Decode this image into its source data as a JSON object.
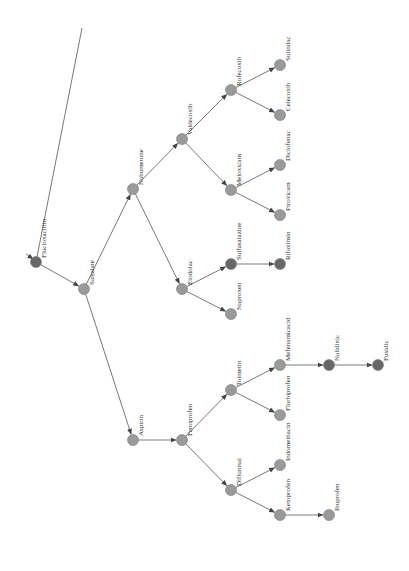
{
  "diagram": {
    "type": "tree",
    "orientation": "rotated",
    "colors": {
      "node_light": "#9a9a9a",
      "node_dark": "#686868",
      "edge": "#555555",
      "text": "#333333"
    },
    "nodes": [
      {
        "id": "flucloxacillin",
        "label": "Flucloxacillin",
        "x": 36,
        "y": 262,
        "shade": "dark"
      },
      {
        "id": "salsalate",
        "label": "Salsalate",
        "x": 84,
        "y": 289,
        "shade": "light"
      },
      {
        "id": "nabumetone",
        "label": "Nabumetone",
        "x": 133,
        "y": 189,
        "shade": "light"
      },
      {
        "id": "aspirin",
        "label": "Aspirin",
        "x": 133,
        "y": 440,
        "shade": "light"
      },
      {
        "id": "valdecoxib",
        "label": "Valdecoxib",
        "x": 182,
        "y": 139,
        "shade": "light"
      },
      {
        "id": "etodolac",
        "label": "Etodolac",
        "x": 182,
        "y": 289,
        "shade": "light"
      },
      {
        "id": "fenoprofen",
        "label": "Fenoprofen",
        "x": 182,
        "y": 440,
        "shade": "light"
      },
      {
        "id": "rofecoxib",
        "label": "Rofecoxib",
        "x": 231,
        "y": 90,
        "shade": "light"
      },
      {
        "id": "meloxicam",
        "label": "Meloxicam",
        "x": 231,
        "y": 190,
        "shade": "light"
      },
      {
        "id": "sulfasalazine",
        "label": "Sulfasalazine",
        "x": 231,
        "y": 264,
        "shade": "dark"
      },
      {
        "id": "naproxen",
        "label": "Naproxen",
        "x": 231,
        "y": 314,
        "shade": "light"
      },
      {
        "id": "tolmetin",
        "label": "Tolmetin",
        "x": 231,
        "y": 390,
        "shade": "light"
      },
      {
        "id": "diflunisal",
        "label": "Diflunisal",
        "x": 231,
        "y": 490,
        "shade": "light"
      },
      {
        "id": "sulindac",
        "label": "Sulindac",
        "x": 280,
        "y": 65,
        "shade": "light"
      },
      {
        "id": "celecoxib",
        "label": "Celecoxib",
        "x": 280,
        "y": 115,
        "shade": "light"
      },
      {
        "id": "diclofenac",
        "label": "Diclofenac",
        "x": 280,
        "y": 165,
        "shade": "light"
      },
      {
        "id": "piroxicam",
        "label": "Piroxicam",
        "x": 280,
        "y": 215,
        "shade": "light"
      },
      {
        "id": "rifaximin",
        "label": "Rifaximin",
        "x": 280,
        "y": 264,
        "shade": "dark"
      },
      {
        "id": "mefenamicacid",
        "label": "Mefenamicacid",
        "x": 280,
        "y": 365,
        "shade": "light"
      },
      {
        "id": "flurbiprofen",
        "label": "Flurbiprofen",
        "x": 280,
        "y": 415,
        "shade": "light"
      },
      {
        "id": "indomethacin",
        "label": "Indomethacin",
        "x": 280,
        "y": 465,
        "shade": "light"
      },
      {
        "id": "ketoprofen",
        "label": "Ketoprofen",
        "x": 280,
        "y": 515,
        "shade": "light"
      },
      {
        "id": "nalidixic",
        "label": "Nalidixic",
        "x": 329,
        "y": 365,
        "shade": "dark"
      },
      {
        "id": "ibuprofen",
        "label": "Ibuprofen",
        "x": 329,
        "y": 515,
        "shade": "light"
      },
      {
        "id": "fusidic",
        "label": "Fusidic",
        "x": 378,
        "y": 365,
        "shade": "dark"
      }
    ],
    "edges": [
      [
        "flucloxacillin",
        "salsalate"
      ],
      [
        "salsalate",
        "nabumetone"
      ],
      [
        "salsalate",
        "aspirin"
      ],
      [
        "nabumetone",
        "valdecoxib"
      ],
      [
        "nabumetone",
        "etodolac"
      ],
      [
        "valdecoxib",
        "rofecoxib"
      ],
      [
        "valdecoxib",
        "meloxicam"
      ],
      [
        "rofecoxib",
        "sulindac"
      ],
      [
        "rofecoxib",
        "celecoxib"
      ],
      [
        "meloxicam",
        "diclofenac"
      ],
      [
        "meloxicam",
        "piroxicam"
      ],
      [
        "etodolac",
        "sulfasalazine"
      ],
      [
        "etodolac",
        "naproxen"
      ],
      [
        "sulfasalazine",
        "rifaximin"
      ],
      [
        "aspirin",
        "fenoprofen"
      ],
      [
        "fenoprofen",
        "tolmetin"
      ],
      [
        "fenoprofen",
        "diflunisal"
      ],
      [
        "tolmetin",
        "mefenamicacid"
      ],
      [
        "tolmetin",
        "flurbiprofen"
      ],
      [
        "diflunisal",
        "indomethacin"
      ],
      [
        "diflunisal",
        "ketoprofen"
      ],
      [
        "mefenamicacid",
        "nalidixic"
      ],
      [
        "nalidixic",
        "fusidic"
      ],
      [
        "ketoprofen",
        "ibuprofen"
      ]
    ],
    "root_lines": [
      {
        "from": [
          36,
          262
        ],
        "to": [
          82,
          28
        ],
        "arrow": false
      },
      {
        "from": [
          26,
          254
        ],
        "to": [
          33,
          259
        ],
        "arrow": true
      }
    ]
  }
}
